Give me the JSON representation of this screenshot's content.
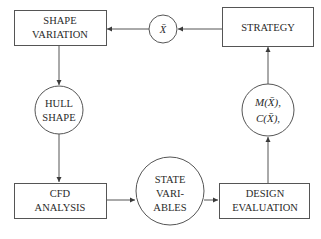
{
  "diagram": {
    "type": "flowchart",
    "nodes": [
      {
        "id": "shape_variation",
        "shape": "rect",
        "lines": [
          "SHAPE",
          "VARIATION"
        ]
      },
      {
        "id": "xbar",
        "shape": "circle",
        "lines": [
          "X̄"
        ]
      },
      {
        "id": "strategy",
        "shape": "rect",
        "lines": [
          "STRATEGY"
        ]
      },
      {
        "id": "hull_shape",
        "shape": "circle",
        "lines": [
          "HULL",
          "SHAPE"
        ]
      },
      {
        "id": "objectives",
        "shape": "circle",
        "lines": [
          "M(X̄),",
          "C(X̄),"
        ]
      },
      {
        "id": "cfd_analysis",
        "shape": "rect",
        "lines": [
          "CFD",
          "ANALYSIS"
        ]
      },
      {
        "id": "state_variables",
        "shape": "circle",
        "lines": [
          "STATE",
          "VARI-",
          "ABLES"
        ]
      },
      {
        "id": "design_evaluation",
        "shape": "rect",
        "lines": [
          "DESIGN",
          "EVALUATION"
        ]
      }
    ],
    "edges": [
      {
        "from": "strategy",
        "to": "xbar"
      },
      {
        "from": "xbar",
        "to": "shape_variation"
      },
      {
        "from": "shape_variation",
        "to": "hull_shape"
      },
      {
        "from": "hull_shape",
        "to": "cfd_analysis"
      },
      {
        "from": "cfd_analysis",
        "to": "state_variables"
      },
      {
        "from": "state_variables",
        "to": "design_evaluation"
      },
      {
        "from": "design_evaluation",
        "to": "objectives"
      },
      {
        "from": "objectives",
        "to": "strategy"
      }
    ],
    "colors": {
      "stroke": "#3a3a3a",
      "text": "#2a2a2a",
      "background": "#ffffff"
    }
  }
}
